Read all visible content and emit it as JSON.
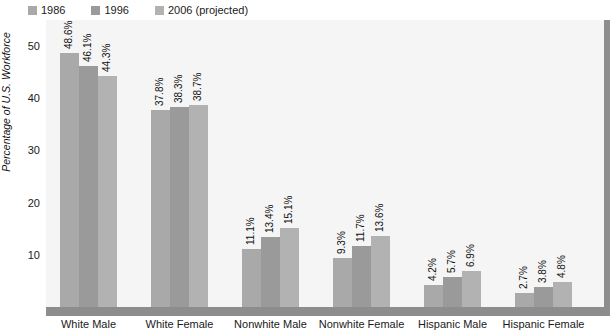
{
  "chart_data": {
    "type": "bar",
    "title": "",
    "xlabel": "",
    "ylabel": "Percentage of U.S. Workforce",
    "ylim": [
      0,
      55
    ],
    "yticks": [
      10,
      20,
      30,
      40,
      50
    ],
    "ytick_labels": [
      "10",
      "20",
      "30",
      "40",
      "50"
    ],
    "grid": false,
    "legend_position": "top-left",
    "categories": [
      "White Male",
      "White Female",
      "Nonwhite Male",
      "Nonwhite Female",
      "Hispanic Male",
      "Hispanic Female"
    ],
    "series": [
      {
        "name": "1986",
        "color": "#a9a9a9",
        "values": [
          48.6,
          37.8,
          11.1,
          9.3,
          4.2,
          2.7
        ],
        "value_labels": [
          "48.6%",
          "37.8%",
          "11.1%",
          "9.3%",
          "4.2%",
          "2.7%"
        ]
      },
      {
        "name": "1996",
        "color": "#9a9a9a",
        "values": [
          46.1,
          38.3,
          13.4,
          11.7,
          5.7,
          3.8
        ],
        "value_labels": [
          "46.1%",
          "38.3%",
          "13.4%",
          "11.7%",
          "5.7%",
          "3.8%"
        ]
      },
      {
        "name": "2006 (projected)",
        "color": "#b2b2b2",
        "values": [
          44.3,
          38.7,
          15.1,
          13.6,
          6.9,
          4.8
        ],
        "value_labels": [
          "44.3%",
          "38.7%",
          "15.1%",
          "13.6%",
          "6.9%",
          "4.8%"
        ]
      }
    ]
  },
  "legend": {
    "items": [
      {
        "label": "1986",
        "color": "#a9a9a9"
      },
      {
        "label": "1996",
        "color": "#9a9a9a"
      },
      {
        "label": "2006 (projected)",
        "color": "#b2b2b2"
      }
    ]
  },
  "colors": {
    "plot_background": "#f5f5f5",
    "axis_line": "#8d8d8d",
    "text": "#1a1a1a"
  }
}
